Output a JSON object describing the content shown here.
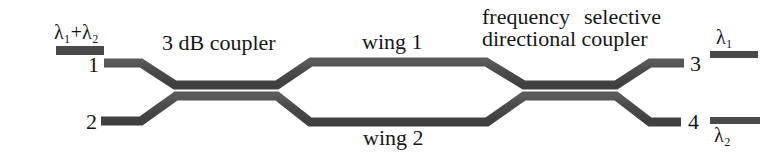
{
  "figure": {
    "kind": "optical-waveguide-schematic",
    "width": 782,
    "height": 160,
    "background": "#ffffff",
    "waveguide_color": "#4a4a4a",
    "text_color": "#161616"
  },
  "labels": {
    "input_wavelengths": "λ₁+λ₂",
    "input_wavelengths_base": "λ",
    "port_1": "1",
    "port_2": "2",
    "port_3": "3",
    "port_4": "4",
    "coupler_3db": "3 dB coupler",
    "wing_1": "wing 1",
    "wing_2": "wing 2",
    "fsdc_line_1_a": "frequency",
    "fsdc_line_1_b": "selective",
    "fsdc_line_2": "directional coupler",
    "output_lambda_1": "λ₁",
    "output_lambda_2": "λ₂"
  },
  "ports": {
    "inputs": [
      {
        "name": "port-1",
        "number": "1",
        "carries": "λ₁+λ₂"
      },
      {
        "name": "port-2",
        "number": "2",
        "carries": ""
      }
    ],
    "outputs": [
      {
        "name": "port-3",
        "number": "3",
        "carries": "λ₁"
      },
      {
        "name": "port-4",
        "number": "4",
        "carries": "λ₂"
      }
    ]
  },
  "components": [
    {
      "name": "3db-coupler",
      "label": "3 dB coupler"
    },
    {
      "name": "wing-1",
      "label": "wing 1"
    },
    {
      "name": "wing-2",
      "label": "wing 2"
    },
    {
      "name": "frequency-selective-directional-coupler",
      "label": "frequency selective directional coupler"
    }
  ]
}
